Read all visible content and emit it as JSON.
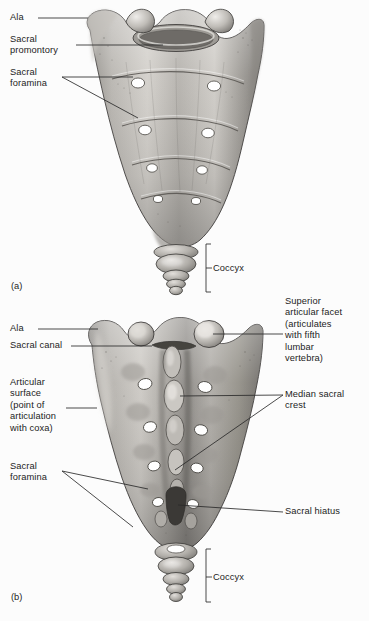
{
  "figure": {
    "background_color": "#fcfcfc",
    "text_color": "#1c1c1c",
    "leader_line_color": "#2a2a2a"
  },
  "panels": [
    {
      "id": "panel-a",
      "letter": "(a)",
      "view": "anterior",
      "letter_pos": {
        "x": 11,
        "y": 281
      },
      "labels": [
        {
          "name": "ala",
          "text": "Ala",
          "x": 10,
          "y": 12,
          "leader": {
            "x1": 38,
            "y1": 18,
            "x2": 88,
            "y2": 18
          }
        },
        {
          "name": "sacral-promontory",
          "text": "Sacral\npromontory",
          "x": 10,
          "y": 34,
          "leader": {
            "x1": 76,
            "y1": 45,
            "x2": 163,
            "y2": 45
          }
        },
        {
          "name": "sacral-foramina",
          "text": "Sacral\nforamina",
          "x": 10,
          "y": 67,
          "leader": {
            "x1": 62,
            "y1": 77,
            "x2": 133,
            "y2": 77
          },
          "leader2": {
            "x1": 62,
            "y1": 77,
            "x2": 138,
            "y2": 118
          }
        },
        {
          "name": "coccyx",
          "text": "Coccyx",
          "x": 213,
          "y": 263,
          "bracket": {
            "x": 206,
            "y1": 244,
            "y2": 292,
            "tick_x": 211,
            "tick_y": 268
          }
        }
      ]
    },
    {
      "id": "panel-b",
      "letter": "(b)",
      "view": "posterior",
      "letter_pos": {
        "x": 11,
        "y": 592
      },
      "labels": [
        {
          "name": "superior-articular-facet",
          "text": "Superior\narticular facet\n(articulates\nwith fifth\nlumbar\nvertebra)",
          "x": 285,
          "y": 296,
          "leader": {
            "x1": 283,
            "y1": 334,
            "x2": 213,
            "y2": 334
          }
        },
        {
          "name": "ala",
          "text": "Ala",
          "x": 10,
          "y": 323,
          "leader": {
            "x1": 38,
            "y1": 329,
            "x2": 98,
            "y2": 329
          }
        },
        {
          "name": "sacral-canal",
          "text": "Sacral canal",
          "x": 10,
          "y": 340,
          "leader": {
            "x1": 71,
            "y1": 346,
            "x2": 152,
            "y2": 346
          }
        },
        {
          "name": "articular-surface",
          "text": "Articular\nsurface\n(point of\narticulation\nwith coxa)",
          "x": 10,
          "y": 377,
          "leader": {
            "x1": 66,
            "y1": 408,
            "x2": 97,
            "y2": 408
          }
        },
        {
          "name": "median-sacral-crest",
          "text": "Median sacral\ncrest",
          "x": 285,
          "y": 389,
          "leader": {
            "x1": 283,
            "y1": 395,
            "x2": 180,
            "y2": 396
          },
          "leader2": {
            "x1": 283,
            "y1": 395,
            "x2": 175,
            "y2": 470
          }
        },
        {
          "name": "sacral-foramina",
          "text": "Sacral\nforamina",
          "x": 10,
          "y": 461,
          "leader": {
            "x1": 62,
            "y1": 471,
            "x2": 148,
            "y2": 489
          },
          "leader2": {
            "x1": 62,
            "y1": 471,
            "x2": 133,
            "y2": 527
          }
        },
        {
          "name": "sacral-hiatus",
          "text": "Sacral hiatus",
          "x": 285,
          "y": 506,
          "leader": {
            "x1": 283,
            "y1": 512,
            "x2": 178,
            "y2": 505
          }
        },
        {
          "name": "coccyx",
          "text": "Coccyx",
          "x": 213,
          "y": 572,
          "bracket": {
            "x": 206,
            "y1": 549,
            "y2": 602,
            "tick_x": 211,
            "tick_y": 577
          }
        }
      ]
    }
  ],
  "anatomy": {
    "bone_fill_light": "#d8d6d2",
    "bone_fill_mid": "#a9a6a2",
    "bone_fill_dark": "#77746f",
    "bone_shadow": "#4f4d4a",
    "foramen_fill": "#ffffff",
    "outline": "#3a3836",
    "panel_a_foramina_pairs": 4,
    "panel_b_foramina_pairs": 4,
    "coccyx_segments": 4
  }
}
